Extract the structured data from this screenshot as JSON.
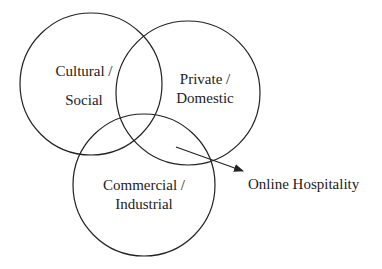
{
  "diagram": {
    "type": "venn",
    "sets": [
      {
        "id": "cultural",
        "line1": "Cultural /",
        "line2": "Social"
      },
      {
        "id": "private",
        "line1": "Private /",
        "line2": "Domestic"
      },
      {
        "id": "commercial",
        "line1": "Commercial /",
        "line2": "Industrial"
      }
    ],
    "callout": {
      "label": "Online Hospitality",
      "points_to": "intersection of all three sets"
    },
    "colors": {
      "stroke": "#222222",
      "text": "#222222",
      "background": "#ffffff"
    }
  }
}
